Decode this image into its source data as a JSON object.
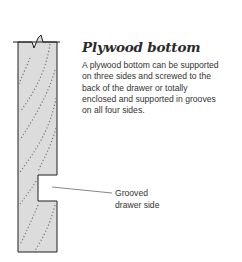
{
  "figure": {
    "title": "Plywood bottom",
    "description_lines": [
      "A plywood bottom can be supported",
      "on three sides and screwed to the",
      "back of the drawer or totally",
      "enclosed and supported in grooves",
      "on all four sides."
    ],
    "callout_lines": [
      "Grooved",
      "drawer side"
    ],
    "colors": {
      "board_fill": "#dcdcdc",
      "outline": "#1e1e1e",
      "grain": "#777777",
      "text": "#333333"
    }
  }
}
